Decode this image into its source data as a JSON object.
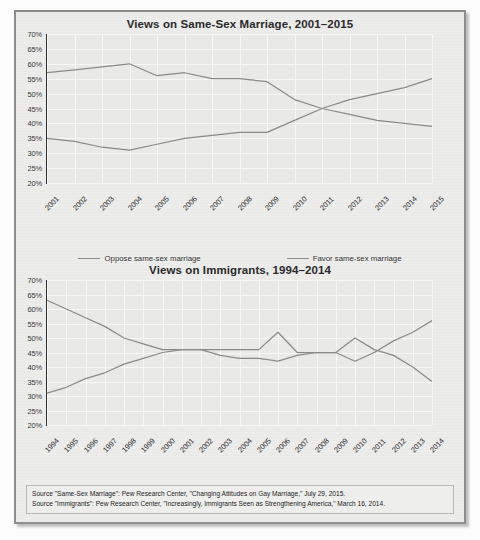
{
  "panel": {
    "border_color": "#8d8d8d",
    "background": "#ececeb"
  },
  "sources": {
    "line1": "Source \"Same-Sex Marriage\": Pew Research Center, \"Changing Attitudes on Gay Marriage,\" July 29, 2015.",
    "line2": "Source \"Immigrants\": Pew Research Center, \"Increasingly, Immigrants Seen as Strengthening America,\" March 16, 2014."
  },
  "chart_data": [
    {
      "type": "line",
      "title": "Views on Same-Sex Marriage, 2001–2015",
      "xlabel": "",
      "ylabel": "",
      "ylim": [
        20,
        70
      ],
      "yticks": [
        70,
        65,
        60,
        55,
        50,
        45,
        40,
        35,
        30,
        25,
        20
      ],
      "ytick_labels": [
        "70%",
        "65%",
        "60%",
        "55%",
        "50%",
        "45%",
        "40%",
        "35%",
        "30%",
        "25%",
        "20%"
      ],
      "grid": true,
      "legend_position": "bottom",
      "categories": [
        "2001",
        "2002",
        "2003",
        "2004",
        "2005",
        "2006",
        "2007",
        "2008",
        "2009",
        "2010",
        "2011",
        "2012",
        "2013",
        "2014",
        "2015"
      ],
      "series": [
        {
          "name": "Oppose same-sex marriage",
          "color": "#8a8a8a",
          "values": [
            57,
            58,
            59,
            60,
            56,
            57,
            55,
            55,
            54,
            48,
            45,
            43,
            41,
            40,
            39
          ]
        },
        {
          "name": "Favor same-sex marriage",
          "color": "#8a8a8a",
          "values": [
            35,
            34,
            32,
            31,
            33,
            35,
            36,
            37,
            37,
            41,
            45,
            48,
            50,
            52,
            55
          ]
        }
      ]
    },
    {
      "type": "line",
      "title": "Views on Immigrants, 1994–2014",
      "xlabel": "",
      "ylabel": "",
      "ylim": [
        20,
        70
      ],
      "yticks": [
        70,
        65,
        60,
        55,
        50,
        45,
        40,
        35,
        30,
        25,
        20
      ],
      "ytick_labels": [
        "70%",
        "65%",
        "60%",
        "55%",
        "50%",
        "45%",
        "40%",
        "35%",
        "30%",
        "25%",
        "20%"
      ],
      "grid": true,
      "legend_position": "bottom",
      "categories": [
        "1994",
        "1995",
        "1996",
        "1997",
        "1998",
        "1999",
        "2000",
        "2001",
        "2002",
        "2003",
        "2004",
        "2005",
        "2006",
        "2007",
        "2008",
        "2009",
        "2010",
        "2011",
        "2012",
        "2013",
        "2014"
      ],
      "series": [
        {
          "name": "Immigrants are a burden on our country",
          "color": "#8a8a8a",
          "values": [
            63,
            60,
            57,
            54,
            50,
            48,
            46,
            46,
            46,
            46,
            46,
            46,
            52,
            45,
            45,
            45,
            50,
            46,
            44,
            40,
            35
          ]
        },
        {
          "name": "Immigrants strengthen our country",
          "color": "#8a8a8a",
          "values": [
            31,
            33,
            36,
            38,
            41,
            43,
            45,
            46,
            46,
            44,
            43,
            43,
            42,
            44,
            45,
            45,
            42,
            45,
            49,
            52,
            56
          ]
        }
      ]
    }
  ]
}
